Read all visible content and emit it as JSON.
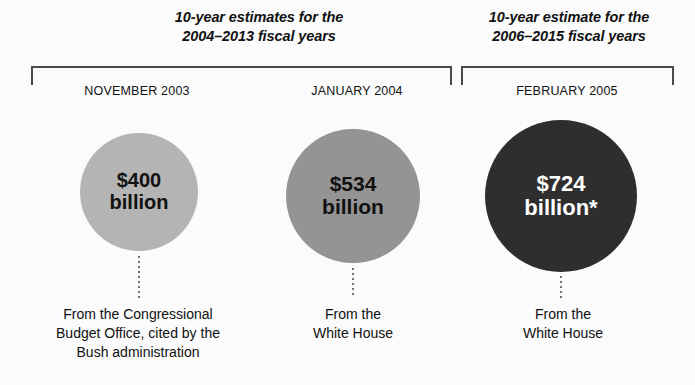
{
  "figure": {
    "background_color": "#fbfbfb",
    "text_color": "#111111"
  },
  "groups": [
    {
      "heading_line1": "10-year estimates for the",
      "heading_line2": "2004–2013 fiscal years"
    },
    {
      "heading_line1": "10-year estimate for the",
      "heading_line2": "2006–2015 fiscal years"
    }
  ],
  "estimates": [
    {
      "date": "NOVEMBER 2003",
      "amount": "$400",
      "unit": "billion",
      "value": 400,
      "currency": "USD",
      "scale": "billion",
      "bubble_color": "#b4b4b4",
      "bubble_text_color": "#111111",
      "caption_line1": "From the Congressional",
      "caption_line2": "Budget Office, cited by the",
      "caption_line3": "Bush administration"
    },
    {
      "date": "JANUARY 2004",
      "amount": "$534",
      "unit": "billion",
      "value": 534,
      "currency": "USD",
      "scale": "billion",
      "bubble_color": "#949494",
      "bubble_text_color": "#111111",
      "caption_line1": "From the",
      "caption_line2": "White House",
      "caption_line3": ""
    },
    {
      "date": "FEBRUARY 2005",
      "amount": "$724",
      "unit": "billion*",
      "value": 724,
      "currency": "USD",
      "scale": "billion",
      "footnote_marker": "*",
      "bubble_color": "#2e2e2e",
      "bubble_text_color": "#ffffff",
      "caption_line1": "From the",
      "caption_line2": "White House",
      "caption_line3": ""
    }
  ],
  "chart_data": {
    "type": "bar",
    "title": "",
    "categories": [
      "NOVEMBER 2003",
      "JANUARY 2004",
      "FEBRUARY 2005"
    ],
    "values": [
      400,
      534,
      724
    ],
    "xlabel": "",
    "ylabel": "Estimate (billions of dollars)",
    "annotations": [
      "10-year estimates for the 2004–2013 fiscal years",
      "10-year estimate for the 2006–2015 fiscal years"
    ]
  }
}
